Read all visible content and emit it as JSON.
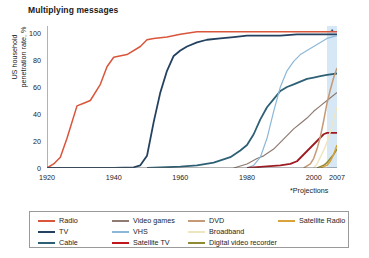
{
  "chart_data": {
    "type": "line",
    "title": "Multiplying messages",
    "xlabel": "",
    "ylabel": "US household penetration rate, %",
    "ylabel_line1": "US household",
    "ylabel_line2": "penetration rate, %",
    "xlim": [
      1920,
      2007
    ],
    "ylim": [
      0,
      100
    ],
    "yticks": [
      0,
      20,
      40,
      60,
      80,
      100
    ],
    "ytick_labels": [
      "0",
      "20",
      "40",
      "60",
      "80",
      "100"
    ],
    "xticks": [
      1920,
      1940,
      1960,
      1980,
      2000,
      2007
    ],
    "xtick_labels": [
      "1920",
      "1940",
      "1960",
      "1980",
      "2000",
      "2007"
    ],
    "xminor_ticks": [
      1925,
      1930,
      1935,
      1945,
      1950,
      1955,
      1965,
      1970,
      1975,
      1985,
      1990,
      1995
    ],
    "grid": false,
    "legend_position": "bottom",
    "annotations": [
      {
        "name": "projection-footnote",
        "text": "*Projections"
      },
      {
        "name": "projection-asterisk",
        "text": "*"
      }
    ],
    "projection_band": {
      "from": 2004,
      "to": 2007,
      "color": "#cfe4f5",
      "label": "*"
    },
    "series": [
      {
        "name": "Radio",
        "color": "#d9553b",
        "width": 1.5,
        "points": [
          [
            1920,
            0
          ],
          [
            1922,
            3
          ],
          [
            1924,
            8
          ],
          [
            1926,
            22
          ],
          [
            1929,
            46
          ],
          [
            1931,
            48
          ],
          [
            1933,
            50
          ],
          [
            1936,
            62
          ],
          [
            1938,
            75
          ],
          [
            1940,
            82
          ],
          [
            1944,
            84
          ],
          [
            1948,
            90
          ],
          [
            1950,
            95
          ],
          [
            1952,
            96
          ],
          [
            1956,
            97
          ],
          [
            1960,
            99
          ],
          [
            1965,
            101
          ],
          [
            1970,
            101
          ],
          [
            1980,
            101
          ],
          [
            1990,
            101
          ],
          [
            2000,
            101
          ],
          [
            2007,
            101
          ]
        ]
      },
      {
        "name": "TV",
        "color": "#24415f",
        "width": 1.8,
        "points": [
          [
            1920,
            0
          ],
          [
            1940,
            0
          ],
          [
            1946,
            0.5
          ],
          [
            1948,
            2
          ],
          [
            1950,
            9
          ],
          [
            1952,
            34
          ],
          [
            1954,
            56
          ],
          [
            1956,
            72
          ],
          [
            1958,
            83
          ],
          [
            1960,
            87
          ],
          [
            1962,
            90
          ],
          [
            1965,
            93
          ],
          [
            1968,
            95
          ],
          [
            1972,
            96
          ],
          [
            1976,
            97
          ],
          [
            1980,
            98
          ],
          [
            1985,
            98
          ],
          [
            1990,
            98
          ],
          [
            1995,
            99
          ],
          [
            2000,
            99
          ],
          [
            2007,
            99
          ]
        ]
      },
      {
        "name": "Cable",
        "color": "#2e6075",
        "width": 1.8,
        "points": [
          [
            1950,
            0
          ],
          [
            1960,
            1
          ],
          [
            1965,
            2
          ],
          [
            1970,
            4
          ],
          [
            1975,
            8
          ],
          [
            1978,
            13
          ],
          [
            1980,
            17
          ],
          [
            1982,
            25
          ],
          [
            1984,
            36
          ],
          [
            1986,
            45
          ],
          [
            1988,
            51
          ],
          [
            1990,
            57
          ],
          [
            1992,
            60
          ],
          [
            1994,
            62
          ],
          [
            1996,
            64
          ],
          [
            1998,
            66
          ],
          [
            2000,
            67
          ],
          [
            2002,
            68
          ],
          [
            2004,
            69
          ],
          [
            2007,
            70
          ]
        ]
      },
      {
        "name": "Video games",
        "color": "#8f7b72",
        "width": 1.2,
        "points": [
          [
            1976,
            0
          ],
          [
            1980,
            3
          ],
          [
            1983,
            7
          ],
          [
            1985,
            9
          ],
          [
            1988,
            14
          ],
          [
            1990,
            19
          ],
          [
            1992,
            24
          ],
          [
            1994,
            29
          ],
          [
            1996,
            33
          ],
          [
            1998,
            37
          ],
          [
            2000,
            42
          ],
          [
            2002,
            46
          ],
          [
            2004,
            50
          ],
          [
            2007,
            56
          ]
        ]
      },
      {
        "name": "VHS",
        "color": "#8cb8d8",
        "width": 1.2,
        "points": [
          [
            1980,
            0
          ],
          [
            1982,
            2
          ],
          [
            1984,
            8
          ],
          [
            1986,
            22
          ],
          [
            1988,
            42
          ],
          [
            1990,
            60
          ],
          [
            1992,
            72
          ],
          [
            1994,
            79
          ],
          [
            1996,
            84
          ],
          [
            1998,
            87
          ],
          [
            2000,
            90
          ],
          [
            2002,
            93
          ],
          [
            2004,
            96
          ],
          [
            2007,
            98
          ]
        ]
      },
      {
        "name": "Satellite TV",
        "color": "#9e1b22",
        "width": 1.8,
        "points": [
          [
            1980,
            0
          ],
          [
            1985,
            1
          ],
          [
            1990,
            2
          ],
          [
            1993,
            3
          ],
          [
            1995,
            5
          ],
          [
            1997,
            10
          ],
          [
            1999,
            15
          ],
          [
            2001,
            20
          ],
          [
            2003,
            25
          ],
          [
            2004,
            26
          ],
          [
            2005,
            26
          ],
          [
            2007,
            26
          ]
        ]
      },
      {
        "name": "DVD",
        "color": "#c49a77",
        "width": 1.5,
        "points": [
          [
            1997,
            0
          ],
          [
            1999,
            3
          ],
          [
            2000,
            7
          ],
          [
            2001,
            14
          ],
          [
            2002,
            23
          ],
          [
            2003,
            35
          ],
          [
            2004,
            48
          ],
          [
            2005,
            58
          ],
          [
            2006,
            67
          ],
          [
            2007,
            74
          ]
        ]
      },
      {
        "name": "Broadband",
        "color": "#efe6c0",
        "width": 1.5,
        "points": [
          [
            2000,
            0
          ],
          [
            2001,
            3
          ],
          [
            2002,
            8
          ],
          [
            2003,
            13
          ],
          [
            2004,
            19
          ],
          [
            2005,
            27
          ],
          [
            2006,
            36
          ],
          [
            2007,
            45
          ]
        ]
      },
      {
        "name": "Digital video recorder",
        "color": "#8f8a34",
        "width": 1.5,
        "points": [
          [
            2001,
            0
          ],
          [
            2002,
            1
          ],
          [
            2003,
            2
          ],
          [
            2004,
            4
          ],
          [
            2005,
            7
          ],
          [
            2006,
            10
          ],
          [
            2007,
            14
          ]
        ]
      },
      {
        "name": "Satellite Radio",
        "color": "#d9a23b",
        "width": 1.5,
        "points": [
          [
            2002,
            0
          ],
          [
            2003,
            1
          ],
          [
            2004,
            2
          ],
          [
            2005,
            5
          ],
          [
            2006,
            10
          ],
          [
            2007,
            17
          ]
        ]
      }
    ]
  },
  "legend": {
    "columns": [
      [
        {
          "label": "Radio",
          "color": "#d9553b"
        },
        {
          "label": "TV",
          "color": "#24415f"
        },
        {
          "label": "Cable",
          "color": "#2e6075"
        }
      ],
      [
        {
          "label": "Video games",
          "color": "#8f7b72"
        },
        {
          "label": "VHS",
          "color": "#8cb8d8"
        },
        {
          "label": "Satellite TV",
          "color": "#c0161d"
        }
      ],
      [
        {
          "label": "DVD",
          "color": "#c49a77"
        },
        {
          "label": "Broadband",
          "color": "#efe6c0"
        },
        {
          "label": "Digital video recorder",
          "color": "#8f8a34"
        }
      ],
      [
        {
          "label": "Satellite Radio",
          "color": "#d9a23b"
        }
      ]
    ]
  }
}
